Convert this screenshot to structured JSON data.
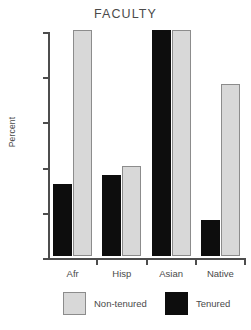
{
  "chart_data": {
    "type": "bar",
    "title": "FACULTY",
    "xlabel": "",
    "ylabel": "Percent",
    "categories": [
      "Afr",
      "Hisp",
      "Asian",
      "Native"
    ],
    "series": [
      {
        "name": "Non-tenured",
        "color": "#d8d8d8",
        "values": [
          5.0,
          2.0,
          5.0,
          3.8
        ]
      },
      {
        "name": "Tenured",
        "color": "#0d0d0d",
        "values": [
          1.6,
          1.8,
          5.0,
          0.8
        ]
      }
    ],
    "ylim": [
      0,
      5
    ],
    "yticks": [
      0,
      1,
      2,
      3,
      4,
      5
    ],
    "ytick_labels": [
      "0",
      "1",
      "2",
      "3",
      "4",
      "5"
    ],
    "grid": false,
    "legend_position": "bottom",
    "bar_order_in_group": [
      "Tenured",
      "Non-tenured"
    ]
  },
  "legend": {
    "entries": [
      {
        "label": "Non-tenured",
        "swatch": "light-gray"
      },
      {
        "label": "Tenured",
        "swatch": "black"
      }
    ]
  }
}
